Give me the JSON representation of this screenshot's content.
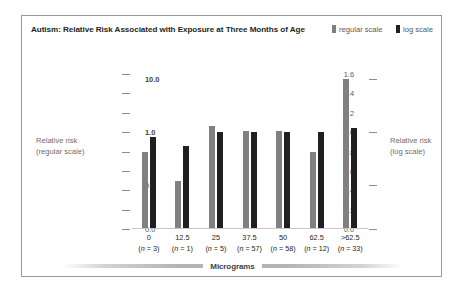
{
  "figure": {
    "title": "Autism: Relative Risk Associated with Exposure at Three Months of Age",
    "border_color": "#9a9a9a",
    "background": "#ffffff"
  },
  "legend": {
    "items": [
      {
        "label": "regular scale",
        "color": "#808083",
        "icon": "bar-swatch-icon"
      },
      {
        "label": "log scale",
        "color": "#231f20",
        "icon": "bar-swatch-icon"
      }
    ]
  },
  "axes": {
    "left": {
      "title": "Relative risk\n(regular scale)",
      "title_line1": "Relative risk",
      "title_line2": "(regular scale)",
      "ticks": [
        "1.6",
        "1.4",
        "1.2",
        "1.0",
        "0.8",
        "0.6",
        "0.4",
        "0.2",
        "0.0"
      ],
      "min": 0.0,
      "max": 1.6
    },
    "right": {
      "title_line1": "Relative risk",
      "title_line2": "(log scale)",
      "ticks": [
        "10.0",
        "1.0",
        "0.1",
        "0.0"
      ],
      "tick_positions": [
        1.55,
        1.0,
        0.45,
        0.0
      ]
    },
    "x": {
      "title": "Micrograms"
    }
  },
  "chart_data": {
    "type": "bar",
    "title": "Autism: Relative Risk Associated with Exposure at Three Months of Age",
    "xlabel": "Micrograms",
    "ylabel": "Relative risk (regular scale)",
    "ylabel_secondary": "Relative risk (log scale)",
    "ylim": [
      0.0,
      1.6
    ],
    "grid": false,
    "legend_position": "top-right",
    "categories": [
      "0",
      "12.5",
      "25",
      "37.5",
      "50",
      "62.5",
      ">62.5"
    ],
    "category_n": [
      3,
      1,
      5,
      57,
      58,
      12,
      33
    ],
    "category_labels": [
      {
        "dose": "0",
        "n": "(n = 3)"
      },
      {
        "dose": "12.5",
        "n": "(n = 1)"
      },
      {
        "dose": "25",
        "n": "(n = 5)"
      },
      {
        "dose": "37.5",
        "n": "(n = 57)"
      },
      {
        "dose": "50",
        "n": "(n = 58)"
      },
      {
        "dose": "62.5",
        "n": "(n = 12)"
      },
      {
        "dose": ">62.5",
        "n": "(n = 33)"
      }
    ],
    "series": [
      {
        "name": "regular scale",
        "color": "#808083",
        "values": [
          0.8,
          0.5,
          1.06,
          1.01,
          1.01,
          0.8,
          1.55
        ]
      },
      {
        "name": "log scale",
        "color": "#231f20",
        "values": [
          0.95,
          0.86,
          1.0,
          1.0,
          1.0,
          1.0,
          1.04
        ]
      }
    ]
  }
}
